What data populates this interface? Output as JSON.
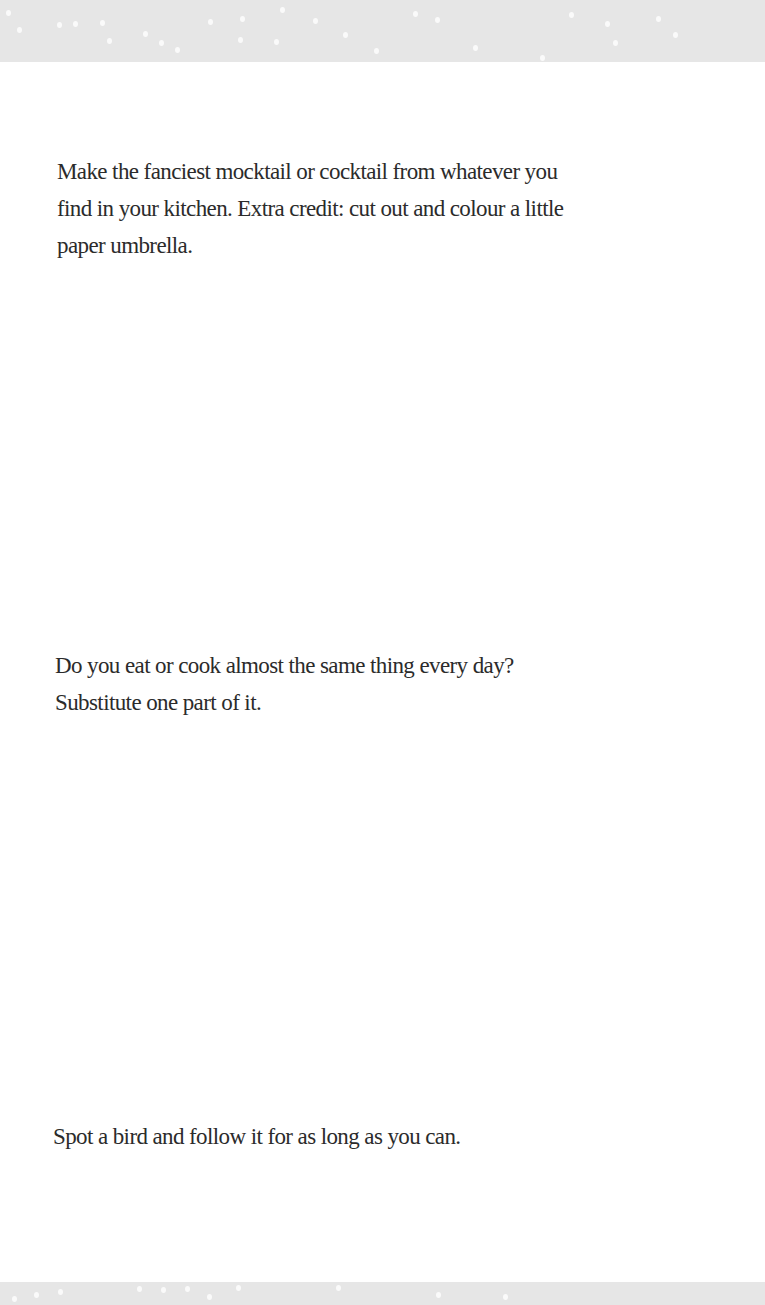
{
  "prompts": [
    {
      "lines": [
        "Make the fanciest mocktail or cocktail from whatever you",
        "find in your kitchen. Extra credit: cut out and colour a little",
        "paper umbrella."
      ]
    },
    {
      "lines": [
        "Do you eat or cook almost the same thing every day?",
        "Substitute one part of it."
      ]
    },
    {
      "lines": [
        "Spot a bird and follow it for as long as you can."
      ]
    }
  ],
  "decoration": {
    "band_color": "#e6e6e6",
    "dot_color": "#fafafa",
    "text_color": "#2b2b2b"
  }
}
